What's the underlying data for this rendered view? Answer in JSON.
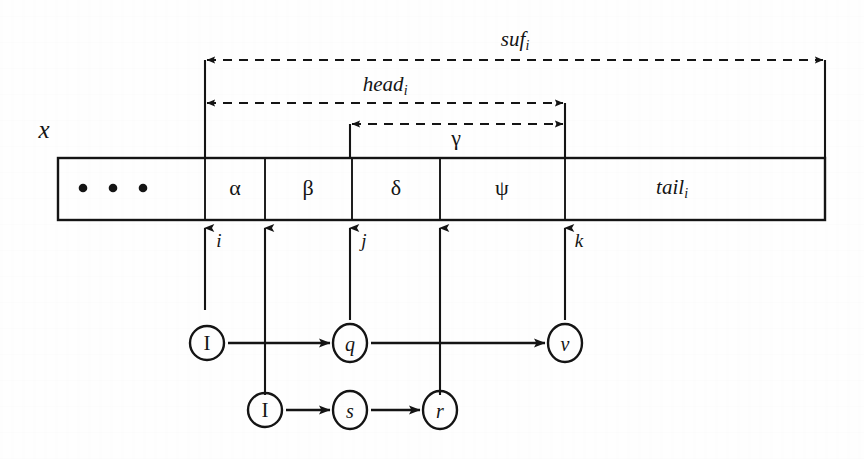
{
  "figure": {
    "type": "string-automaton-diagram",
    "background_color": "#fefefe",
    "ink_color": "#141414",
    "string_label": "x",
    "measures": [
      {
        "name": "suf",
        "subscript": "i",
        "label": "suf",
        "from_x": 205,
        "to_x": 825,
        "y": 60,
        "style": "dashed-double-arrow"
      },
      {
        "name": "head",
        "subscript": "i",
        "label": "head",
        "from_x": 205,
        "to_x": 565,
        "y": 103,
        "style": "dashed-double-arrow"
      },
      {
        "name": "gamma",
        "subscript": "",
        "label": "γ",
        "from_x": 350,
        "to_x": 565,
        "y": 124,
        "style": "dashed-double-arrow"
      }
    ],
    "cells": [
      {
        "label": "• • •",
        "kind": "ellipsis",
        "x0": 58,
        "x1": 205
      },
      {
        "label": "α",
        "kind": "symbol",
        "x0": 205,
        "x1": 265
      },
      {
        "label": "β",
        "kind": "symbol",
        "x0": 265,
        "x1": 352
      },
      {
        "label": "δ",
        "kind": "symbol",
        "x0": 352,
        "x1": 440
      },
      {
        "label": "ψ",
        "kind": "symbol",
        "x0": 440,
        "x1": 565
      },
      {
        "label": "tail",
        "subscript": "i",
        "kind": "named",
        "x0": 565,
        "x1": 825
      }
    ],
    "box": {
      "left": 58,
      "right": 825,
      "top": 158,
      "bottom": 220
    },
    "position_markers": [
      {
        "label": "i",
        "x": 205,
        "top": 310
      },
      {
        "label": "",
        "x": 265,
        "top": 395
      },
      {
        "label": "j",
        "x": 350,
        "top": 320
      },
      {
        "label": "",
        "x": 440,
        "top": 395
      },
      {
        "label": "k",
        "x": 565,
        "top": 320
      }
    ],
    "state_rows": [
      {
        "row": 1,
        "y": 343,
        "states": [
          {
            "label": "I",
            "x": 207,
            "rx": 17,
            "ry": 17
          },
          {
            "label": "q",
            "x": 350,
            "rx": 17,
            "ry": 19
          },
          {
            "label": "v",
            "x": 565,
            "rx": 17,
            "ry": 19
          }
        ],
        "transitions": [
          {
            "from": "I",
            "to": "q"
          },
          {
            "from": "q",
            "to": "v"
          }
        ]
      },
      {
        "row": 2,
        "y": 410,
        "states": [
          {
            "label": "I",
            "x": 265,
            "rx": 17,
            "ry": 17
          },
          {
            "label": "s",
            "x": 350,
            "rx": 17,
            "ry": 19
          },
          {
            "label": "r",
            "x": 440,
            "rx": 17,
            "ry": 19
          }
        ],
        "transitions": [
          {
            "from": "I",
            "to": "s"
          },
          {
            "from": "s",
            "to": "r"
          }
        ]
      }
    ],
    "ellipsis_dots": [
      {
        "cx": 83,
        "cy": 188
      },
      {
        "cx": 113,
        "cy": 188
      },
      {
        "cx": 143,
        "cy": 188
      }
    ],
    "text_labels": {
      "x": "x",
      "suf": "suf",
      "suf_sub": "i",
      "head": "head",
      "head_sub": "i",
      "gamma": "γ",
      "alpha": "α",
      "beta": "β",
      "delta": "δ",
      "psi": "ψ",
      "tail": "tail",
      "tail_sub": "i",
      "idx_i": "i",
      "idx_j": "j",
      "idx_k": "k",
      "state_I1": "I",
      "state_q": "q",
      "state_v": "v",
      "state_I2": "I",
      "state_s": "s",
      "state_r": "r"
    }
  }
}
